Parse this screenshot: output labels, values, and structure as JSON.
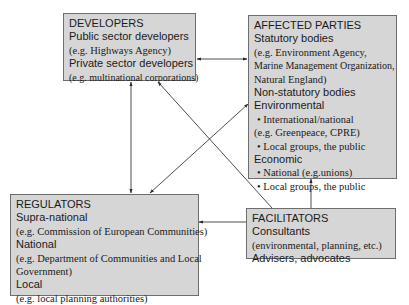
{
  "boxes": {
    "developers": {
      "title": "DEVELOPERS",
      "lines": [
        {
          "text": "Public sector developers",
          "style": "sans"
        },
        {
          "text": "(e.g. Highways Agency)",
          "style": "serif"
        },
        {
          "text": "Private sector developers",
          "style": "sans"
        },
        {
          "text": "(e.g. multinational corporations)",
          "style": "serif"
        }
      ]
    },
    "affected_parties": {
      "title": "AFFECTED PARTIES",
      "lines": [
        {
          "text": "Statutory bodies",
          "style": "sans"
        },
        {
          "text": "(e.g. Environment Agency,",
          "style": "serif"
        },
        {
          "text": "Marine Management Organization,",
          "style": "serif"
        },
        {
          "text": "Natural England)",
          "style": "serif"
        },
        {
          "text": "Non-statutory bodies",
          "style": "sans"
        },
        {
          "text": "Environmental",
          "style": "sans"
        },
        {
          "text": "• International/national",
          "style": "serif-bullet"
        },
        {
          "text": "(e.g. Greenpeace, CPRE)",
          "style": "serif"
        },
        {
          "text": "• Local groups, the public",
          "style": "serif-bullet"
        },
        {
          "text": "Economic",
          "style": "sans"
        },
        {
          "text": "• National (e.g.unions)",
          "style": "serif-bullet"
        },
        {
          "text": "• Local groups, the public",
          "style": "serif-bullet"
        }
      ]
    },
    "regulators": {
      "title": "REGULATORS",
      "lines": [
        {
          "text": "Supra-national",
          "style": "sans"
        },
        {
          "text": "(e.g. Commission of European Communities)",
          "style": "serif"
        },
        {
          "text": "National",
          "style": "sans"
        },
        {
          "text": "(e.g. Department of Communities and Local",
          "style": "serif"
        },
        {
          "text": "Government)",
          "style": "serif"
        },
        {
          "text": "Local",
          "style": "sans"
        },
        {
          "text": "(e.g. local planning authorities)",
          "style": "serif"
        }
      ]
    },
    "facilitators": {
      "title": "FACILITATORS",
      "lines": [
        {
          "text": "Consultants",
          "style": "sans"
        },
        {
          "text": "(environmental, planning, etc.)",
          "style": "serif"
        },
        {
          "text": "Advisers, advocates",
          "style": "sans"
        }
      ]
    }
  },
  "connections": [
    {
      "from": "developers",
      "to": "affected_parties",
      "type": "bidirectional"
    },
    {
      "from": "developers",
      "to": "regulators",
      "type": "bidirectional"
    },
    {
      "from": "affected_parties",
      "to": "regulators",
      "type": "bidirectional"
    },
    {
      "from": "facilitators",
      "to": "developers",
      "type": "directed"
    },
    {
      "from": "facilitators",
      "to": "affected_parties",
      "type": "directed"
    },
    {
      "from": "facilitators",
      "to": "regulators",
      "type": "directed"
    }
  ],
  "colors": {
    "box_fill": "#d6d6d6",
    "box_border": "#6e6e6e",
    "line": "#3a3a3a",
    "text": "#1a1a1a"
  }
}
